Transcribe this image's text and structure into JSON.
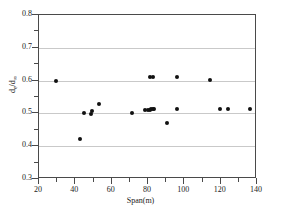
{
  "chart_data": {
    "type": "scatter",
    "title": "",
    "xlabel": "Span(m)",
    "ylabel_numerator": "d",
    "ylabel_num_sub": "e",
    "ylabel_denominator": "d",
    "ylabel_den_sub": "∞",
    "ylabel_full": "de/d∞",
    "xlim": [
      20,
      140
    ],
    "ylim": [
      0.3,
      0.8
    ],
    "xticks": [
      20,
      40,
      60,
      80,
      100,
      120,
      140
    ],
    "xtick_labels": [
      "20",
      "40",
      "60",
      "80",
      "100",
      "120",
      "140"
    ],
    "yticks": [
      0.3,
      0.4,
      0.5,
      0.6,
      0.7,
      0.8
    ],
    "ytick_labels": [
      "0.3",
      "0.4",
      "0.5",
      "0.6",
      "0.7",
      "0.8"
    ],
    "x_minor_ticks": [
      30,
      50,
      70,
      90,
      110,
      130
    ],
    "y_minor_ticks": [
      0.35,
      0.45,
      0.55,
      0.65,
      0.75
    ],
    "grid": "horizontal",
    "grid_color": "#c9c9c9",
    "marker": "filled-circle",
    "marker_color": "#111111",
    "marker_size": 4,
    "frame_color": "#4a4a4a",
    "background": "#ffffff",
    "legend": "none",
    "series": [
      {
        "name": "measurements",
        "points": [
          [
            29.5,
            0.6
          ],
          [
            42.8,
            0.421
          ],
          [
            45.0,
            0.5
          ],
          [
            48.4,
            0.499
          ],
          [
            49.2,
            0.508
          ],
          [
            53.0,
            0.53
          ],
          [
            71.3,
            0.502
          ],
          [
            78.5,
            0.51
          ],
          [
            80.0,
            0.511
          ],
          [
            81.0,
            0.511
          ],
          [
            81.8,
            0.512
          ],
          [
            82.6,
            0.512
          ],
          [
            83.4,
            0.512
          ],
          [
            81.2,
            0.611
          ],
          [
            83.0,
            0.611
          ],
          [
            90.6,
            0.472
          ],
          [
            95.8,
            0.512
          ],
          [
            96.2,
            0.611
          ],
          [
            114.2,
            0.602
          ],
          [
            119.8,
            0.513
          ],
          [
            124.2,
            0.513
          ],
          [
            136.0,
            0.513
          ]
        ]
      }
    ]
  }
}
